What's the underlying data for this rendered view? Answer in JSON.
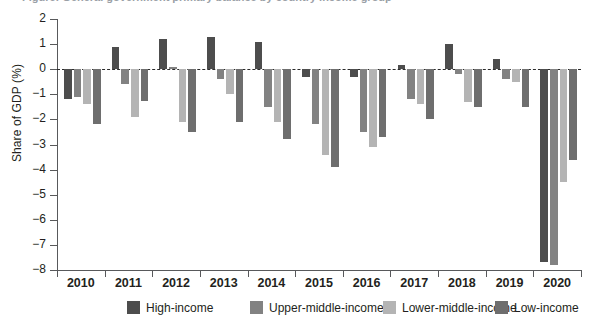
{
  "figure": {
    "clipped_title": "Figure: General government primary balance by country income group",
    "y_axis_title": "Share of GDP (%)"
  },
  "chart_data": {
    "type": "bar",
    "title": "",
    "subtitle": "",
    "xlabel": "",
    "ylabel": "Share of GDP (%)",
    "ylim": [
      -8,
      2
    ],
    "yticks": [
      2,
      1,
      0,
      -1,
      -2,
      -3,
      -4,
      -5,
      -6,
      -7,
      -8
    ],
    "ytick_labels": [
      "2",
      "1",
      "0",
      "−1",
      "−2",
      "−3",
      "−4",
      "−5",
      "−6",
      "−7",
      "−8"
    ],
    "grid": false,
    "zero_reference_line": true,
    "legend_position": "bottom",
    "categories": [
      "2010",
      "2011",
      "2012",
      "2013",
      "2014",
      "2015",
      "2016",
      "2017",
      "2018",
      "2019",
      "2020"
    ],
    "series": [
      {
        "name": "High-income",
        "color": "#4d4d4d",
        "values": [
          -1.2,
          0.9,
          1.2,
          1.3,
          1.1,
          -0.3,
          -0.3,
          0.15,
          1.0,
          0.4,
          -7.7
        ]
      },
      {
        "name": "Upper-middle-income",
        "color": "#828282",
        "values": [
          -1.1,
          -0.6,
          0.1,
          -0.4,
          -1.5,
          -2.2,
          -2.5,
          -1.2,
          -0.2,
          -0.4,
          -7.8
        ]
      },
      {
        "name": "Lower-middle-income",
        "color": "#b4b4b4",
        "values": [
          -1.4,
          -1.9,
          -2.1,
          -1.0,
          -2.1,
          -3.4,
          -3.1,
          -1.4,
          -1.3,
          -0.5,
          -4.5
        ]
      },
      {
        "name": "Low-income",
        "color": "#6e6e6e",
        "values": [
          -2.2,
          -1.25,
          -2.5,
          -2.1,
          -2.8,
          -3.9,
          -2.7,
          -2.0,
          -1.5,
          -1.5,
          -3.6
        ]
      }
    ]
  },
  "legend": {
    "items": [
      {
        "label": "High-income",
        "color": "#4d4d4d"
      },
      {
        "label": "Upper-middle-income",
        "color": "#828282"
      },
      {
        "label": "Lower-middle-income",
        "color": "#b4b4b4"
      },
      {
        "label": "Low-income",
        "color": "#6e6e6e"
      }
    ]
  }
}
